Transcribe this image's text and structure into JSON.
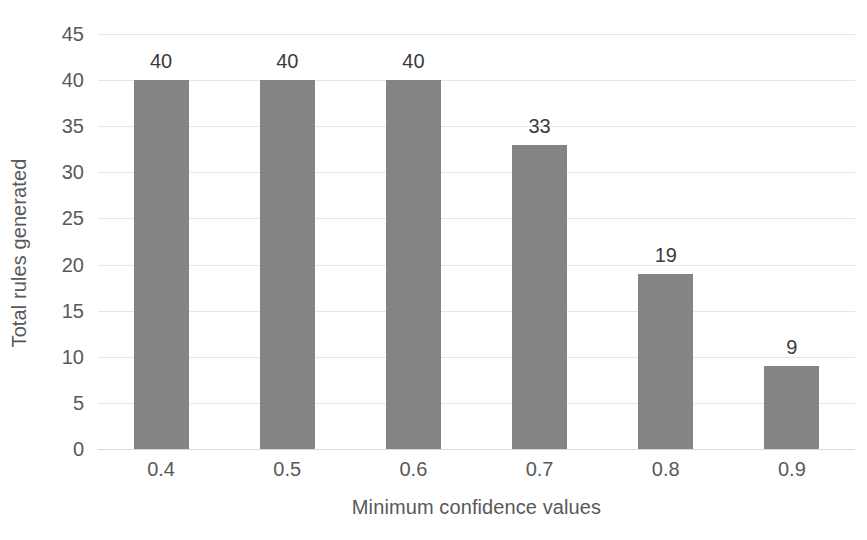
{
  "chart_data": {
    "type": "bar",
    "title": "",
    "subtitle": "",
    "xlabel": "Minimum confidence values",
    "ylabel": "Total rules generated",
    "categories": [
      "0.4",
      "0.5",
      "0.6",
      "0.7",
      "0.8",
      "0.9"
    ],
    "values": [
      40,
      40,
      40,
      33,
      19,
      9
    ],
    "data_labels": [
      "40",
      "40",
      "40",
      "33",
      "19",
      "9"
    ],
    "ylim": [
      0,
      45
    ],
    "ytick_values": [
      0,
      5,
      10,
      15,
      20,
      25,
      30,
      35,
      40,
      45
    ],
    "ytick_labels": [
      "0",
      "5",
      "10",
      "15",
      "20",
      "25",
      "30",
      "35",
      "40",
      "45"
    ],
    "grid": true,
    "grid_axis": "y",
    "legend": false,
    "legend_position": "none",
    "series": [
      {
        "name": "Total rules generated",
        "values": [
          40,
          40,
          40,
          33,
          19,
          9
        ],
        "color": "#848484"
      }
    ],
    "colors": {
      "bar": "#848484",
      "gridline": "#e6e6e6",
      "baseline": "#d9d9d9",
      "axis_text": "#595959",
      "data_label_text": "#3b3b3b",
      "background": "#ffffff"
    }
  }
}
